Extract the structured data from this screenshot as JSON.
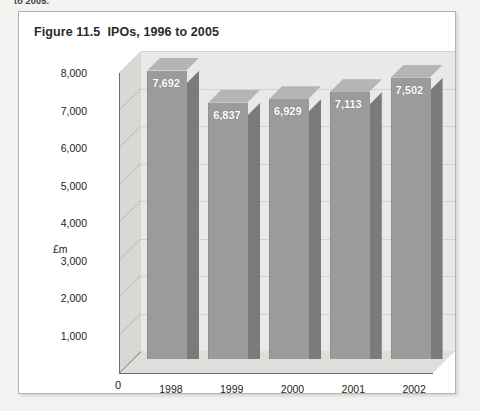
{
  "page": {
    "cut_off_text": "to 2005."
  },
  "figure": {
    "number": "Figure 11.5",
    "caption": "IPOs, 1996 to 2005"
  },
  "chart_data": {
    "type": "bar",
    "xlabel": "",
    "ylabel": "£m",
    "categories": [
      "1998",
      "1999",
      "2000",
      "2001",
      "2002"
    ],
    "values": [
      7692,
      6837,
      6929,
      7113,
      7502
    ],
    "value_labels": [
      "7,692",
      "6,837",
      "6,929",
      "7,113",
      "7,502"
    ],
    "ylim": [
      0,
      8000
    ],
    "yticks": [
      0,
      1000,
      2000,
      3000,
      4000,
      5000,
      6000,
      7000,
      8000
    ],
    "ytick_labels": [
      "0",
      "1,000",
      "2,000",
      "3,000",
      "4,000",
      "5,000",
      "6,000",
      "7,000",
      "8,000"
    ],
    "grid": true,
    "legend": false,
    "style": "3d-column",
    "colors": {
      "bar_front": "#9b9b9b",
      "bar_side": "#7b7b7b",
      "bar_top": "#b5b5b5",
      "back_wall": "#e9e9e7",
      "left_wall": "#d8d8d4",
      "floor": "#dededa",
      "gridline": "#d2d2ce",
      "axis": "#6e6e6e",
      "data_label_text": "#ffffff",
      "page_background": "#f2f2f0",
      "panel_background": "#ffffff",
      "panel_border": "#b4b4b4"
    }
  }
}
